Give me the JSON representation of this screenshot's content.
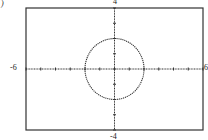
{
  "panel_label": ")",
  "chart_data": {
    "type": "line",
    "title": "",
    "equation": "x^2 + y^2 = 4",
    "series": [
      {
        "name": "circle",
        "center": [
          0,
          0
        ],
        "radius": 2
      }
    ],
    "xlim": [
      -6,
      6
    ],
    "ylim": [
      -4,
      4
    ],
    "xscale": 1,
    "yscale": 1,
    "tick_labels": {
      "xmin": "-6",
      "xmax": "6",
      "ymax": "4",
      "ymin": "-4"
    },
    "grid": false,
    "style": "dotted"
  }
}
